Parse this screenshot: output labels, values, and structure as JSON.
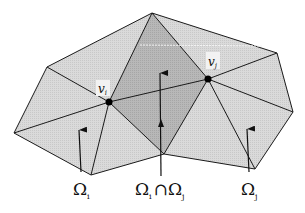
{
  "diagram": {
    "title": "",
    "vertices": {
      "v_i": {
        "label": "v",
        "sub": "i",
        "x": 109,
        "y": 102
      },
      "v_j": {
        "label": "v",
        "sub": "j",
        "x": 208,
        "y": 79
      }
    },
    "regions": {
      "omega_i": {
        "label": "Ω",
        "sub": "i"
      },
      "intersection": {
        "left": "Ω",
        "left_sub": "i",
        "op": "∩",
        "right": "Ω",
        "right_sub": "j"
      },
      "omega_j": {
        "label": "Ω",
        "sub": "j"
      }
    },
    "colors": {
      "light_fill": "#d6d6d6",
      "dark_fill": "#b3b3b3",
      "edge": "#1a1a1a",
      "node": "#000000",
      "background": "#ffffff"
    }
  }
}
